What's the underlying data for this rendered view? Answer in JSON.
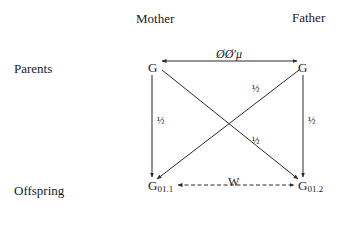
{
  "columns": {
    "mother": "Mother",
    "father": "Father"
  },
  "rows": {
    "parents": "Parents",
    "offspring": "Offspring"
  },
  "nodes": {
    "mother_g": "G",
    "father_g": "G",
    "offspring1_base": "G",
    "offspring1_sub": "01.1",
    "offspring2_base": "G",
    "offspring2_sub": "01.2"
  },
  "edges": {
    "parent_correlation": "ØØ′μ",
    "mother_to_off1": "½",
    "father_to_off1": "½",
    "mother_to_off2": "½",
    "father_to_off2": "½",
    "offspring_correlation": "W"
  },
  "colors": {
    "line": "#2a2a2a",
    "text": "#1a1a1a",
    "background": "#ffffff"
  }
}
